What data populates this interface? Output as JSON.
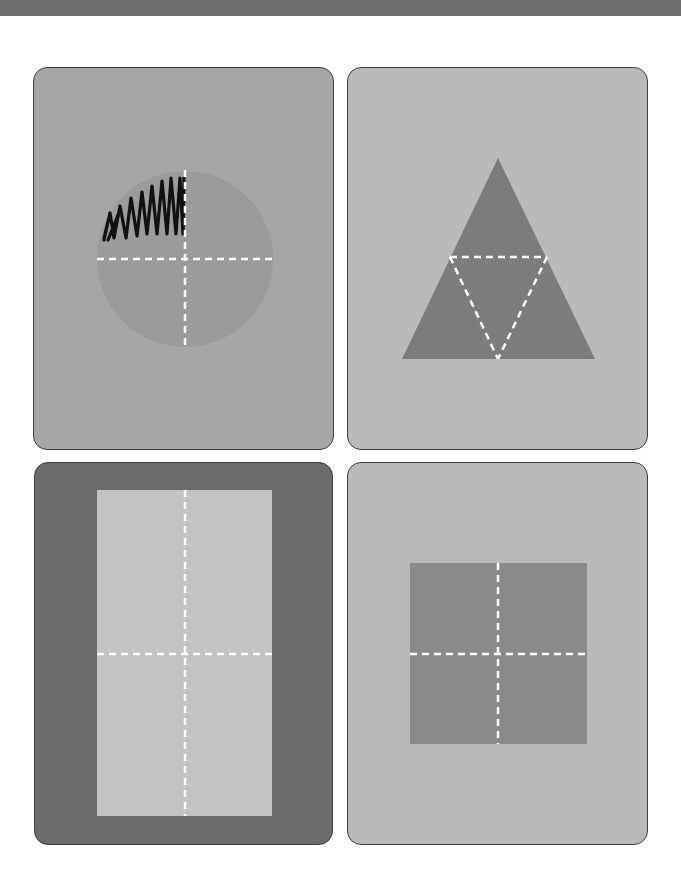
{
  "page": {
    "background": "#ffffff",
    "top_bar_color": "#6e6e6e"
  },
  "cards": [
    {
      "id": "circle-card",
      "shape": "circle",
      "divisions": 4,
      "shaded_parts": 1,
      "shaded_part_position": "top-left quarter scribbled",
      "fraction_shaded": "1/4",
      "card_color": "#a6a6a6",
      "shape_color": "#9b9b9b"
    },
    {
      "id": "triangle-card",
      "shape": "triangle",
      "divisions": 4,
      "shaded_parts": 0,
      "card_color": "#bababa",
      "shape_color": "#7c7c7c"
    },
    {
      "id": "rectangle-card",
      "shape": "rectangle",
      "divisions": 4,
      "shaded_parts": 0,
      "card_color": "#6b6b6b",
      "shape_color": "#c3c3c3"
    },
    {
      "id": "square-card",
      "shape": "square",
      "divisions": 4,
      "shaded_parts": 0,
      "card_color": "#bababa",
      "shape_color": "#8a8a8a"
    }
  ],
  "dash_color": "#ffffff",
  "scribble_color": "#111111"
}
